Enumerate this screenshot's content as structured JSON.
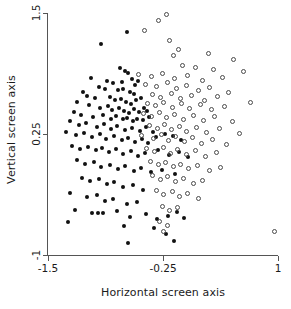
{
  "chart_data": {
    "type": "scatter",
    "title": "",
    "xlabel": "Horizontal screen axis",
    "ylabel": "Vertical screen axis",
    "xlim": [
      -1.5,
      1.0
    ],
    "ylim": [
      -1.0,
      1.5
    ],
    "xticks": [
      -1.5,
      -0.25,
      1
    ],
    "xticklabels": [
      "-1.5",
      "-0.25",
      "1"
    ],
    "yticks": [
      1.5,
      0.25,
      -1
    ],
    "yticklabels": [
      "1.5",
      "0.25",
      "-1"
    ],
    "grid": false,
    "legend": "none",
    "series": [
      {
        "name": "filled-group",
        "marker": "filled-circle",
        "color": "#111111",
        "points": [
          [
            -0.64,
            1.3
          ],
          [
            -0.92,
            1.18
          ],
          [
            -0.72,
            0.93
          ],
          [
            -0.66,
            0.9
          ],
          [
            -0.63,
            0.88
          ],
          [
            -1.03,
            0.83
          ],
          [
            -0.86,
            0.8
          ],
          [
            -0.79,
            0.78
          ],
          [
            -0.7,
            0.79
          ],
          [
            -0.59,
            0.82
          ],
          [
            -0.55,
            0.76
          ],
          [
            -0.52,
            0.8
          ],
          [
            -0.95,
            0.74
          ],
          [
            -0.88,
            0.71
          ],
          [
            -0.74,
            0.7
          ],
          [
            -0.68,
            0.72
          ],
          [
            -0.61,
            0.68
          ],
          [
            -0.57,
            0.66
          ],
          [
            -1.12,
            0.68
          ],
          [
            -1.08,
            0.64
          ],
          [
            -0.99,
            0.62
          ],
          [
            -0.83,
            0.63
          ],
          [
            -0.77,
            0.6
          ],
          [
            -0.71,
            0.61
          ],
          [
            -0.65,
            0.58
          ],
          [
            -0.6,
            0.56
          ],
          [
            -0.54,
            0.6
          ],
          [
            -0.49,
            0.62
          ],
          [
            -1.18,
            0.58
          ],
          [
            -1.05,
            0.55
          ],
          [
            -0.93,
            0.52
          ],
          [
            -0.85,
            0.54
          ],
          [
            -0.8,
            0.5
          ],
          [
            -0.73,
            0.52
          ],
          [
            -0.67,
            0.49
          ],
          [
            -0.62,
            0.47
          ],
          [
            -0.56,
            0.51
          ],
          [
            -0.51,
            0.48
          ],
          [
            -0.46,
            0.52
          ],
          [
            -0.42,
            0.49
          ],
          [
            -1.22,
            0.48
          ],
          [
            -1.14,
            0.45
          ],
          [
            -1.01,
            0.43
          ],
          [
            -0.9,
            0.45
          ],
          [
            -0.82,
            0.41
          ],
          [
            -0.76,
            0.44
          ],
          [
            -0.69,
            0.4
          ],
          [
            -0.64,
            0.42
          ],
          [
            -0.58,
            0.38
          ],
          [
            -0.53,
            0.41
          ],
          [
            -0.47,
            0.39
          ],
          [
            -0.4,
            0.43
          ],
          [
            -1.26,
            0.38
          ],
          [
            -1.16,
            0.34
          ],
          [
            -1.09,
            0.36
          ],
          [
            -0.97,
            0.32
          ],
          [
            -0.89,
            0.35
          ],
          [
            -0.81,
            0.3
          ],
          [
            -0.75,
            0.33
          ],
          [
            -0.66,
            0.29
          ],
          [
            -0.59,
            0.31
          ],
          [
            -0.5,
            0.28
          ],
          [
            -0.44,
            0.32
          ],
          [
            -0.36,
            0.27
          ],
          [
            -1.3,
            0.27
          ],
          [
            -1.2,
            0.24
          ],
          [
            -1.11,
            0.26
          ],
          [
            -1.02,
            0.22
          ],
          [
            -0.94,
            0.25
          ],
          [
            -0.87,
            0.2
          ],
          [
            -0.78,
            0.23
          ],
          [
            -0.7,
            0.19
          ],
          [
            -0.63,
            0.21
          ],
          [
            -0.55,
            0.17
          ],
          [
            -0.48,
            0.2
          ],
          [
            -0.41,
            0.16
          ],
          [
            -0.33,
            0.22
          ],
          [
            -0.23,
            0.25
          ],
          [
            -0.14,
            0.23
          ],
          [
            -0.05,
            0.19
          ],
          [
            -1.24,
            0.13
          ],
          [
            -1.15,
            0.1
          ],
          [
            -1.06,
            0.12
          ],
          [
            -0.98,
            0.08
          ],
          [
            -0.91,
            0.11
          ],
          [
            -0.84,
            0.06
          ],
          [
            -0.76,
            0.09
          ],
          [
            -0.68,
            0.04
          ],
          [
            -0.6,
            0.07
          ],
          [
            -0.52,
            0.02
          ],
          [
            -0.45,
            0.05
          ],
          [
            -0.3,
            0.08
          ],
          [
            -0.18,
            0.03
          ],
          [
            -0.08,
            0.06
          ],
          [
            0.02,
            0.01
          ],
          [
            -1.19,
            -0.02
          ],
          [
            -1.1,
            -0.06
          ],
          [
            -1.0,
            -0.04
          ],
          [
            -0.92,
            -0.09
          ],
          [
            -0.83,
            -0.07
          ],
          [
            -0.74,
            -0.11
          ],
          [
            -0.66,
            -0.08
          ],
          [
            -0.57,
            -0.13
          ],
          [
            -0.49,
            -0.1
          ],
          [
            -0.38,
            -0.14
          ],
          [
            -0.26,
            -0.12
          ],
          [
            -0.12,
            -0.16
          ],
          [
            -1.13,
            -0.2
          ],
          [
            -1.04,
            -0.24
          ],
          [
            -0.95,
            -0.22
          ],
          [
            -0.86,
            -0.27
          ],
          [
            -0.78,
            -0.25
          ],
          [
            -0.69,
            -0.3
          ],
          [
            -0.58,
            -0.28
          ],
          [
            -0.47,
            -0.33
          ],
          [
            -1.26,
            -0.36
          ],
          [
            -1.08,
            -0.4
          ],
          [
            -0.97,
            -0.38
          ],
          [
            -0.88,
            -0.44
          ],
          [
            -0.79,
            -0.42
          ],
          [
            -0.64,
            -0.47
          ],
          [
            -0.53,
            -0.45
          ],
          [
            -1.21,
            -0.54
          ],
          [
            -1.02,
            -0.57
          ],
          [
            -0.96,
            -0.57
          ],
          [
            -0.9,
            -0.57
          ],
          [
            -0.75,
            -0.55
          ],
          [
            -0.61,
            -0.61
          ],
          [
            -0.44,
            -0.58
          ],
          [
            -0.31,
            -0.63
          ],
          [
            -0.2,
            -0.6
          ],
          [
            -0.1,
            -0.56
          ],
          [
            -0.02,
            -0.62
          ],
          [
            -1.28,
            -0.66
          ],
          [
            -0.67,
            -0.7
          ],
          [
            -0.35,
            -0.72
          ],
          [
            -0.22,
            -0.78
          ],
          [
            -0.63,
            -0.88
          ],
          [
            -0.13,
            -0.86
          ]
        ]
      },
      {
        "name": "open-group",
        "marker": "open-circle",
        "color": "#4a4a4a",
        "points": [
          [
            -0.21,
            1.48
          ],
          [
            -0.3,
            1.42
          ],
          [
            -0.45,
            1.32
          ],
          [
            -0.18,
            1.22
          ],
          [
            -0.08,
            1.12
          ],
          [
            -0.14,
            1.06
          ],
          [
            0.24,
            1.08
          ],
          [
            0.52,
            1.02
          ],
          [
            -0.04,
            0.96
          ],
          [
            0.1,
            0.94
          ],
          [
            0.3,
            0.92
          ],
          [
            0.62,
            0.9
          ],
          [
            -0.52,
            0.86
          ],
          [
            -0.38,
            0.84
          ],
          [
            -0.26,
            0.88
          ],
          [
            -0.12,
            0.82
          ],
          [
            0.02,
            0.85
          ],
          [
            0.18,
            0.8
          ],
          [
            0.4,
            0.83
          ],
          [
            -0.44,
            0.76
          ],
          [
            -0.32,
            0.74
          ],
          [
            -0.2,
            0.78
          ],
          [
            -0.1,
            0.72
          ],
          [
            0.0,
            0.75
          ],
          [
            0.14,
            0.7
          ],
          [
            0.26,
            0.73
          ],
          [
            0.46,
            0.68
          ],
          [
            -0.36,
            0.66
          ],
          [
            -0.28,
            0.63
          ],
          [
            -0.16,
            0.67
          ],
          [
            -0.06,
            0.62
          ],
          [
            0.06,
            0.65
          ],
          [
            0.2,
            0.6
          ],
          [
            0.34,
            0.64
          ],
          [
            0.7,
            0.58
          ],
          [
            -0.42,
            0.57
          ],
          [
            -0.33,
            0.54
          ],
          [
            -0.24,
            0.58
          ],
          [
            -0.15,
            0.52
          ],
          [
            -0.05,
            0.56
          ],
          [
            0.04,
            0.51
          ],
          [
            0.16,
            0.55
          ],
          [
            0.28,
            0.5
          ],
          [
            0.42,
            0.53
          ],
          [
            -0.46,
            0.46
          ],
          [
            -0.37,
            0.43
          ],
          [
            -0.29,
            0.47
          ],
          [
            -0.21,
            0.42
          ],
          [
            -0.13,
            0.45
          ],
          [
            -0.03,
            0.4
          ],
          [
            0.08,
            0.44
          ],
          [
            0.19,
            0.39
          ],
          [
            0.31,
            0.43
          ],
          [
            0.5,
            0.38
          ],
          [
            -0.4,
            0.34
          ],
          [
            -0.31,
            0.31
          ],
          [
            -0.23,
            0.35
          ],
          [
            -0.16,
            0.3
          ],
          [
            -0.07,
            0.33
          ],
          [
            0.01,
            0.28
          ],
          [
            0.11,
            0.32
          ],
          [
            0.22,
            0.27
          ],
          [
            0.36,
            0.31
          ],
          [
            0.58,
            0.26
          ],
          [
            -0.48,
            0.23
          ],
          [
            -0.35,
            0.2
          ],
          [
            -0.27,
            0.24
          ],
          [
            -0.19,
            0.18
          ],
          [
            -0.11,
            0.22
          ],
          [
            -0.02,
            0.17
          ],
          [
            0.07,
            0.21
          ],
          [
            0.17,
            0.15
          ],
          [
            0.29,
            0.19
          ],
          [
            0.44,
            0.14
          ],
          [
            -0.43,
            0.1
          ],
          [
            -0.34,
            0.07
          ],
          [
            -0.25,
            0.11
          ],
          [
            -0.17,
            0.05
          ],
          [
            -0.09,
            0.09
          ],
          [
            0.0,
            0.04
          ],
          [
            0.1,
            0.08
          ],
          [
            0.21,
            0.02
          ],
          [
            0.33,
            0.06
          ],
          [
            -0.39,
            -0.03
          ],
          [
            -0.3,
            -0.07
          ],
          [
            -0.22,
            -0.04
          ],
          [
            -0.14,
            -0.09
          ],
          [
            -0.06,
            -0.06
          ],
          [
            0.03,
            -0.11
          ],
          [
            0.13,
            -0.08
          ],
          [
            0.25,
            -0.13
          ],
          [
            0.38,
            -0.1
          ],
          [
            -0.36,
            -0.18
          ],
          [
            -0.28,
            -0.22
          ],
          [
            -0.2,
            -0.19
          ],
          [
            -0.11,
            -0.24
          ],
          [
            -0.03,
            -0.21
          ],
          [
            0.08,
            -0.26
          ],
          [
            0.18,
            -0.23
          ],
          [
            -0.32,
            -0.33
          ],
          [
            -0.24,
            -0.37
          ],
          [
            -0.15,
            -0.34
          ],
          [
            -0.07,
            -0.4
          ],
          [
            0.02,
            -0.36
          ],
          [
            0.14,
            -0.42
          ],
          [
            -0.26,
            -0.5
          ],
          [
            -0.18,
            -0.54
          ],
          [
            -0.09,
            -0.51
          ],
          [
            -0.29,
            -0.65
          ],
          [
            -0.2,
            -0.7
          ],
          [
            -0.24,
            -0.76
          ],
          [
            0.96,
            -0.76
          ]
        ]
      }
    ]
  }
}
